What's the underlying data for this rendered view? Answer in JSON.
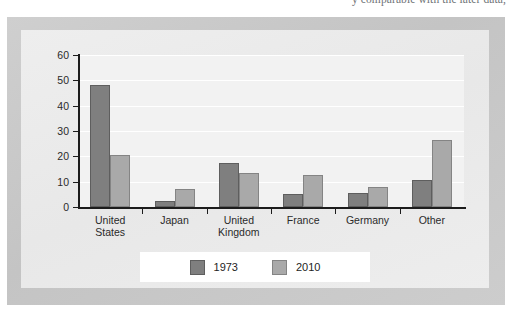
{
  "page": {
    "top_cut_text": "y comparable with the later data,"
  },
  "chart_data": {
    "type": "bar",
    "title": "",
    "xlabel": "",
    "ylabel": "",
    "ylim": [
      0,
      60
    ],
    "yticks": [
      0,
      10,
      20,
      30,
      40,
      50,
      60
    ],
    "ytick_labels": [
      "0",
      "10",
      "20",
      "30",
      "40",
      "50",
      "60"
    ],
    "grid": true,
    "legend_position": "bottom-center",
    "categories": [
      "United States",
      "Japan",
      "United Kingdom",
      "France",
      "Germany",
      "Other"
    ],
    "category_lines": [
      [
        "United",
        "States"
      ],
      [
        "Japan"
      ],
      [
        "United",
        "Kingdom"
      ],
      [
        "France"
      ],
      [
        "Germany"
      ],
      [
        "Other"
      ]
    ],
    "series": [
      {
        "name": "1973",
        "color": "#7f7f7f",
        "values": [
          48,
          2.5,
          17.5,
          5,
          5.5,
          10.5
        ]
      },
      {
        "name": "2010",
        "color": "#a9a9a9",
        "values": [
          20.5,
          7,
          13.5,
          12.5,
          8,
          26.5
        ]
      }
    ]
  },
  "legend": {
    "items": [
      {
        "label": "1973",
        "swatch": "#7f7f7f"
      },
      {
        "label": "2010",
        "swatch": "#a9a9a9"
      }
    ]
  }
}
